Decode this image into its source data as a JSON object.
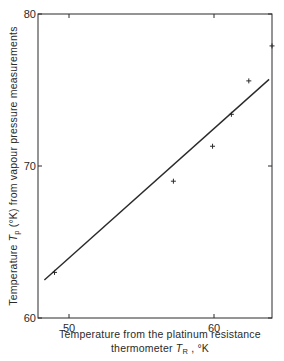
{
  "chart_data": {
    "type": "scatter",
    "title": "",
    "xlabel_line1": "Temperature from the platinum resistance",
    "xlabel_line2_prefix": "thermometer ",
    "xlabel_symbol": "T",
    "xlabel_subscript": "R",
    "xlabel_suffix": " , °K",
    "ylabel_prefix": "Temperature ",
    "ylabel_symbol": "T",
    "ylabel_subscript": "p",
    "ylabel_suffix": " (°K) from vapour pressure measurements",
    "xlim": [
      48,
      64.2
    ],
    "ylim": [
      60,
      80
    ],
    "xticks": [
      50,
      60
    ],
    "yticks": [
      60,
      70,
      80
    ],
    "x_tick_labels": [
      "50",
      "60"
    ],
    "y_tick_labels": [
      "60",
      "70",
      "80"
    ],
    "grid": false,
    "legend": null,
    "series": [
      {
        "name": "measurements",
        "marker": "+",
        "points": [
          {
            "x": 49.0,
            "y": 63.0
          },
          {
            "x": 57.2,
            "y": 69.0
          },
          {
            "x": 59.9,
            "y": 71.3
          },
          {
            "x": 61.2,
            "y": 73.4
          },
          {
            "x": 62.4,
            "y": 75.6
          },
          {
            "x": 64.0,
            "y": 77.9
          }
        ]
      },
      {
        "name": "fit line",
        "type": "line",
        "points": [
          {
            "x": 48.3,
            "y": 62.5
          },
          {
            "x": 63.8,
            "y": 75.7
          }
        ]
      }
    ]
  },
  "colors": {
    "ink": "#2a2a2a",
    "background": "#ffffff"
  }
}
